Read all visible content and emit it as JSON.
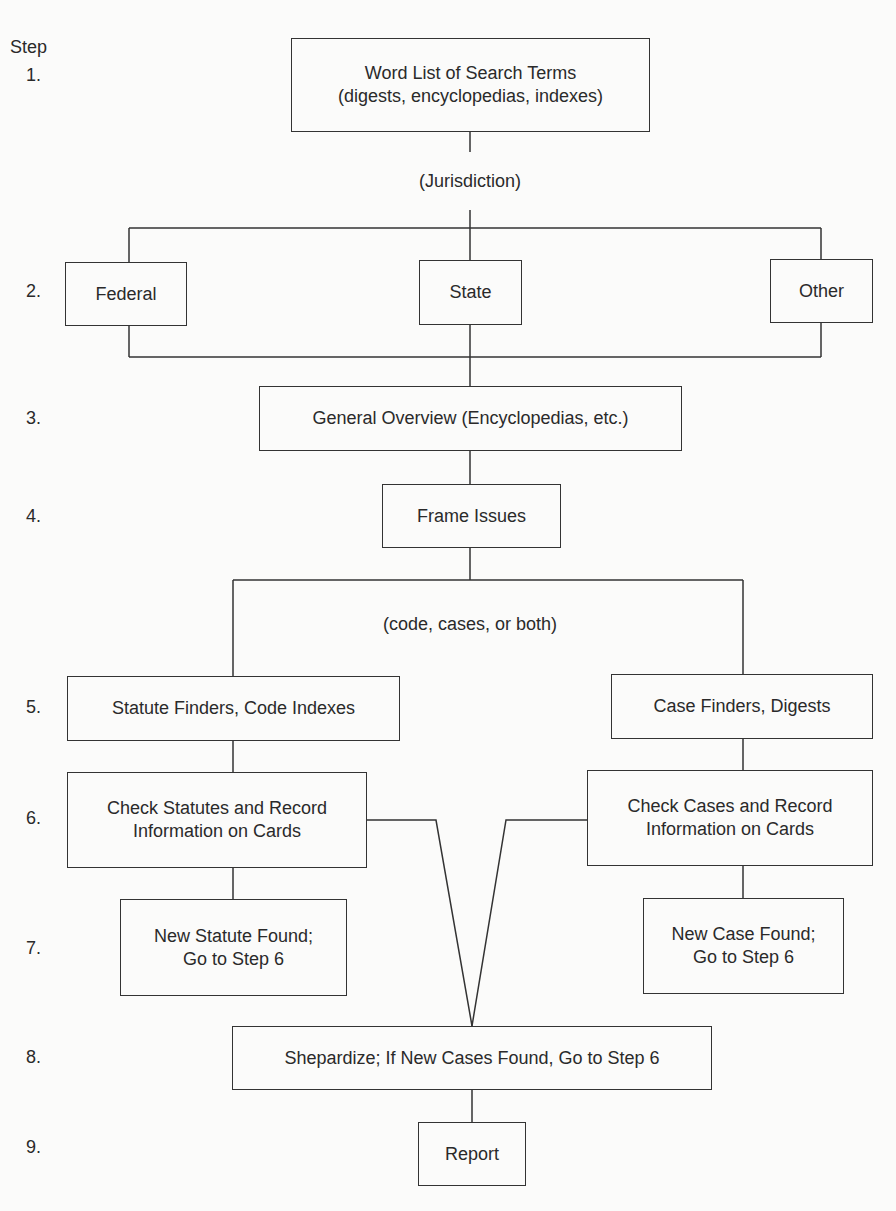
{
  "header": {
    "step_label": "Step"
  },
  "steps": [
    "1.",
    "2.",
    "3.",
    "4.",
    "5.",
    "6.",
    "7.",
    "8.",
    "9."
  ],
  "notes": {
    "jurisdiction": "(Jurisdiction)",
    "code_cases": "(code, cases, or both)"
  },
  "boxes": {
    "word_list": "Word List of Search Terms\n(digests, encyclopedias, indexes)",
    "federal": "Federal",
    "state": "State",
    "other": "Other",
    "overview": "General Overview (Encyclopedias, etc.)",
    "frame_issues": "Frame Issues",
    "statute_finders": "Statute Finders, Code Indexes",
    "case_finders": "Case Finders,  Digests",
    "check_statutes": "Check Statutes and Record\nInformation on Cards",
    "check_cases": "Check Cases and Record\nInformation on Cards",
    "new_statute": "New Statute Found;\nGo to Step 6",
    "new_case": "New Case Found;\nGo to Step 6",
    "shepardize": "Shepardize; If New Cases Found, Go to Step 6",
    "report": "Report"
  },
  "colors": {
    "line": "#333333",
    "background": "#fbfbfa",
    "text": "#2a2a2a"
  }
}
